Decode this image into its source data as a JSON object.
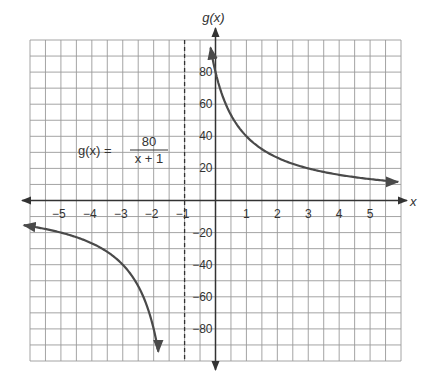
{
  "chart_data": {
    "type": "line",
    "title": "",
    "function_label": {
      "lhs": "g(x) =",
      "numerator": "80",
      "denominator": "x + 1"
    },
    "xlabel": "x",
    "ylabel": "g(x)",
    "xlim": [
      -6,
      6
    ],
    "ylim": [
      -100,
      100
    ],
    "x_ticks": [
      -5,
      -4,
      -3,
      -2,
      -1,
      1,
      2,
      3,
      4,
      5
    ],
    "x_tick_labels": [
      "−5",
      "−4",
      "−3",
      "−2",
      "−1",
      "1",
      "2",
      "3",
      "4",
      "5"
    ],
    "y_ticks": [
      80,
      60,
      40,
      20,
      -20,
      -40,
      -60,
      -80
    ],
    "y_tick_labels": [
      "80",
      "60",
      "40",
      "20",
      "−20",
      "−40",
      "−60",
      "−80"
    ],
    "grid": true,
    "grid_step_x": 0.5,
    "grid_step_y": 10,
    "vertical_asymptote": -1,
    "series": [
      {
        "name": "g(x) = 80/(x+1), right branch",
        "x": [
          -0.15,
          0,
          0.5,
          1,
          2,
          3,
          4,
          5,
          5.9
        ],
        "y": [
          94.1,
          80,
          53.3,
          40,
          26.7,
          20,
          16,
          13.3,
          11.6
        ]
      },
      {
        "name": "g(x) = 80/(x+1), left branch",
        "x": [
          -6.2,
          -6,
          -5,
          -4,
          -3,
          -2,
          -1.85
        ],
        "y": [
          -15.4,
          -16,
          -20,
          -26.7,
          -40,
          -80,
          -94.1
        ]
      }
    ],
    "colors": {
      "curve": "#4a4a4a",
      "grid": "#9a9a9a",
      "axis": "#333333"
    }
  }
}
